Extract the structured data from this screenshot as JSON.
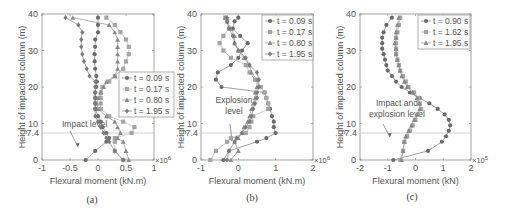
{
  "chart_data": [
    {
      "type": "line",
      "panel": "(a)",
      "xlabel": "Flexural moment (kN.m)",
      "ylabel": "Height of impacted column (m)",
      "x_multiplier": "×10^6",
      "xlim": [
        -1,
        1
      ],
      "ylim": [
        0,
        40
      ],
      "xticks": [
        "-1",
        "-0.5",
        "0",
        "0.5",
        "1"
      ],
      "yticks": [
        "0",
        "10",
        "20",
        "30",
        "40"
      ],
      "reference_line": {
        "y": 7.4,
        "label": "7.4"
      },
      "annotation": "Impact level",
      "legend_position": "right-center",
      "heights": [
        0,
        2.5,
        5,
        6,
        7.4,
        9,
        10.5,
        12,
        14,
        15.5,
        17,
        18.5,
        20,
        21.5,
        23,
        25,
        27,
        29,
        31,
        33,
        35,
        37,
        39
      ],
      "series": [
        {
          "name": "t = 0.09 s",
          "marker": "circle",
          "values": [
            -0.22,
            -0.05,
            0.15,
            0.2,
            0.15,
            0.08,
            0.05,
            0.0,
            -0.05,
            -0.05,
            -0.05,
            -0.05,
            -0.03,
            -0.02,
            -0.03,
            -0.05,
            -0.06,
            -0.06,
            -0.05,
            -0.05,
            0.0,
            0.0,
            0.0
          ]
        },
        {
          "name": "t = 0.17 s",
          "marker": "square",
          "values": [
            0.45,
            0.3,
            0.3,
            0.3,
            0.6,
            0.65,
            0.45,
            0.2,
            0.05,
            0.05,
            0.05,
            0.05,
            0.08,
            0.2,
            0.3,
            0.45,
            0.5,
            0.55,
            0.55,
            0.5,
            0.4,
            0.3,
            0.15
          ]
        },
        {
          "name": "t = 0.80 s",
          "marker": "triangle",
          "values": [
            0.55,
            0.5,
            0.45,
            0.35,
            0.4,
            0.35,
            0.3,
            0.15,
            0.0,
            -0.02,
            0.0,
            0.05,
            0.1,
            0.15,
            0.3,
            0.35,
            0.35,
            0.35,
            0.35,
            0.35,
            0.3,
            0.2,
            -0.45
          ]
        },
        {
          "name": "t = 1.95 s",
          "marker": "diamond",
          "values": [
            0.45,
            0.3,
            0.2,
            0.15,
            0.1,
            0.05,
            0.0,
            -0.05,
            -0.05,
            -0.05,
            -0.05,
            -0.05,
            -0.05,
            -0.05,
            -0.15,
            -0.2,
            -0.25,
            -0.28,
            -0.3,
            -0.3,
            -0.28,
            -0.35,
            -0.58
          ]
        }
      ]
    },
    {
      "type": "line",
      "panel": "(b)",
      "xlabel": "Flexural moment (kN.m)",
      "ylabel": "Height of impacted column (m)",
      "x_multiplier": "×10^6",
      "xlim": [
        -1,
        2
      ],
      "ylim": [
        0,
        40
      ],
      "xticks": [
        "-1",
        "0",
        "1",
        "2"
      ],
      "yticks": [
        "0",
        "10",
        "20",
        "30",
        "40"
      ],
      "reference_line": {
        "y": 7.4,
        "label": "7.4"
      },
      "annotation": "Explosion level",
      "legend_position": "upper-right",
      "heights": [
        0,
        2.5,
        5,
        6,
        7.4,
        9,
        10.5,
        12,
        14,
        15.5,
        17,
        18.5,
        20,
        22,
        24,
        26,
        28,
        30,
        32,
        34,
        36,
        38,
        39
      ],
      "series": [
        {
          "name": "t = 0.09 s",
          "marker": "circle",
          "values": [
            -0.4,
            -0.25,
            0.5,
            0.75,
            1.0,
            0.95,
            0.95,
            0.9,
            0.85,
            0.8,
            0.75,
            0.7,
            -0.45,
            -0.6,
            -0.55,
            -0.2,
            0.0,
            0.1,
            0.25,
            0.05,
            -0.15,
            -0.1,
            0.0
          ]
        },
        {
          "name": "t = 0.17 s",
          "marker": "square",
          "values": [
            -0.75,
            -0.6,
            -0.3,
            -0.2,
            0.2,
            0.3,
            0.35,
            0.4,
            0.8,
            0.8,
            0.75,
            0.7,
            0.6,
            0.45,
            0.3,
            0.2,
            -0.2,
            -0.4,
            -0.5,
            -0.4,
            -0.25,
            -0.3,
            -0.35
          ]
        },
        {
          "name": "t = 0.80 s",
          "marker": "triangle",
          "values": [
            -0.2,
            0.0,
            -0.1,
            0.0,
            0.1,
            0.15,
            0.25,
            0.3,
            0.35,
            0.4,
            0.45,
            0.45,
            0.5,
            0.5,
            0.35,
            0.3,
            0.15,
            0.0,
            -0.1,
            -0.1,
            -0.2,
            -0.3,
            -0.35
          ]
        },
        {
          "name": "t = 1.95 s",
          "marker": "diamond",
          "values": [
            -0.3,
            -0.25,
            -0.1,
            -0.05,
            0.1,
            0.2,
            0.3,
            0.35,
            0.4,
            0.45,
            0.5,
            0.5,
            0.55,
            0.55,
            0.5,
            0.3,
            0.2,
            0.0,
            -0.1,
            -0.15,
            -0.25,
            -0.3,
            -0.3
          ]
        }
      ]
    },
    {
      "type": "line",
      "panel": "(c)",
      "xlabel": "Flexural moment (kN)",
      "ylabel": "Height of impacted column (m)",
      "x_multiplier": "×10^5",
      "xlim": [
        -2,
        2
      ],
      "ylim": [
        0,
        40
      ],
      "xticks": [
        "-2",
        "-1",
        "0",
        "1",
        "2"
      ],
      "yticks": [
        "0",
        "10",
        "20",
        "30",
        "40"
      ],
      "reference_line": {
        "y": 7.4,
        "label": "7.4"
      },
      "annotation": "Impact and explosion level",
      "legend_position": "upper-right",
      "heights": [
        0,
        2.5,
        5,
        6.5,
        8,
        9.5,
        11,
        12.5,
        14,
        15.5,
        17,
        18.5,
        20,
        21.5,
        23,
        24.5,
        26,
        27.5,
        29,
        30.5,
        32,
        33.5,
        35,
        37,
        39
      ],
      "series": [
        {
          "name": "t = 0.90 s",
          "marker": "circle",
          "values": [
            -0.8,
            0.45,
            0.95,
            1.1,
            1.2,
            1.25,
            1.2,
            1.05,
            0.8,
            0.5,
            0.15,
            -0.2,
            -0.5,
            -0.7,
            -0.85,
            -1.0,
            -1.05,
            -1.1,
            -1.15,
            -1.2,
            -1.2,
            -1.2,
            -1.15,
            -1.05,
            -0.85
          ]
        },
        {
          "name": "t = 1.62 s",
          "marker": "square",
          "values": [
            -0.55,
            -0.45,
            -0.4,
            -0.3,
            -0.2,
            -0.1,
            0.0,
            0.1,
            0.2,
            0.15,
            0.1,
            -0.05,
            -0.25,
            -0.35,
            -0.45,
            -0.55,
            -0.6,
            -0.65,
            -0.7,
            -0.7,
            -0.7,
            -0.7,
            -0.65,
            -0.6,
            -0.55
          ]
        },
        {
          "name": "t = 1.95 s",
          "marker": "triangle",
          "values": [
            -0.5,
            -0.45,
            -0.4,
            -0.35,
            -0.25,
            -0.15,
            -0.05,
            0.05,
            0.15,
            0.15,
            0.05,
            -0.1,
            -0.3,
            -0.4,
            -0.5,
            -0.55,
            -0.6,
            -0.65,
            -0.7,
            -0.7,
            -0.75,
            -0.7,
            -0.7,
            -0.65,
            -0.6
          ]
        }
      ]
    }
  ]
}
